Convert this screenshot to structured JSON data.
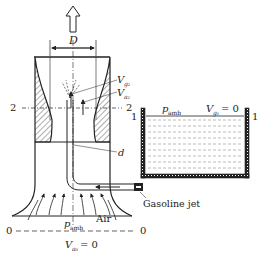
{
  "diagram": {
    "title": "",
    "labels": {
      "throat_diameter": "D",
      "tube_diameter": "d",
      "section_2_left": "2",
      "section_2_right": "2",
      "section_1_left": "1",
      "section_1_right": "1",
      "section_0_left": "0",
      "section_0_right": "0",
      "v_g2_main": "V",
      "v_g2_sub": "g₂",
      "v_a2_main": "V",
      "v_a2_sub": "a₂",
      "p_amb_tank_main": "p",
      "p_amb_tank_sub": "amb",
      "v_g1_main": "V",
      "v_g1_sub": "g₁",
      "v_g1_eq": "= 0",
      "p_amb_inlet_main": "p",
      "p_amb_inlet_sub": "amb",
      "air": "Air",
      "v_a0_main": "V",
      "v_a0_sub": "a₀",
      "v_a0_eq": "= 0",
      "gasoline_jet": "Gasoline jet"
    },
    "arrows": {
      "outflow": "up-arrow",
      "fuel_flow": "left-arrow",
      "air_inflow": "up-arrows"
    },
    "colors": {
      "line": "#222222",
      "hatch": "#333333",
      "liquid_dash": "#555555"
    }
  }
}
